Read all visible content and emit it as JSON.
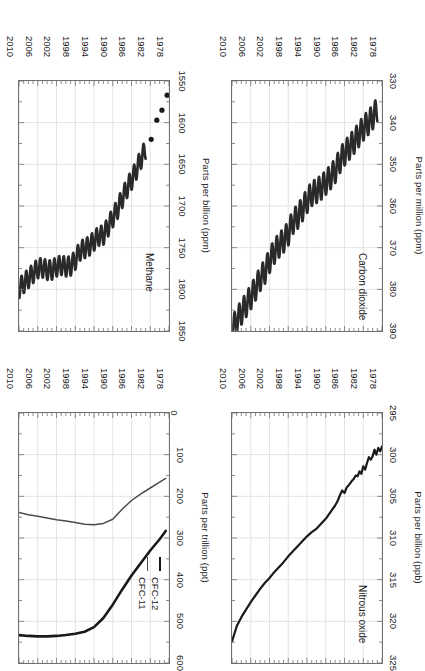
{
  "figure": {
    "orientation": "rotated-180",
    "layout": "2x2 grid of time-series panels",
    "line_color": "#1a1a1a",
    "frame_color": "#6f6f6f",
    "grid_color": "#d8d8d8"
  },
  "chart_data": [
    {
      "id": "nitrous-oxide",
      "type": "line",
      "title": "Nitrous oxide",
      "xlabel": "",
      "ylabel": "Parts per billion (ppb)",
      "xlim": [
        1978,
        2010
      ],
      "ylim": [
        295,
        325
      ],
      "yticks": [
        295,
        300,
        305,
        310,
        315,
        320,
        325
      ],
      "xticks": [
        1978,
        1982,
        1986,
        1990,
        1994,
        1998,
        2002,
        2006,
        2010
      ],
      "grid": true,
      "legend": null,
      "series": [
        {
          "name": "N2O",
          "x": [
            1978.0,
            1978.4,
            1978.8,
            1979.2,
            1979.6,
            1980.0,
            1980.4,
            1980.8,
            1981.2,
            1981.6,
            1982.0,
            1982.4,
            1982.8,
            1983.2,
            1983.6,
            1984.0,
            1984.5,
            1985.0,
            1985.5,
            1986.0,
            1986.5,
            1987.0,
            1987.5,
            1988.0,
            1989.0,
            1990.0,
            1991.0,
            1992.0,
            1993.0,
            1994.0,
            1995.0,
            1996.0,
            1997.0,
            1998.0,
            1999.0,
            2000.0,
            2001.0,
            2002.0,
            2003.0,
            2004.0,
            2005.0,
            2006.0,
            2007.0,
            2008.0,
            2009.0,
            2010.0
          ],
          "y": [
            299.0,
            299.6,
            299.2,
            300.0,
            299.4,
            300.2,
            300.6,
            300.3,
            301.0,
            301.8,
            301.4,
            302.3,
            302.0,
            302.6,
            302.5,
            302.9,
            303.2,
            303.6,
            303.9,
            304.6,
            304.3,
            304.9,
            305.6,
            306.1,
            306.9,
            307.7,
            308.3,
            308.9,
            309.3,
            309.8,
            310.4,
            311.0,
            311.6,
            312.2,
            312.9,
            313.5,
            314.1,
            314.8,
            315.4,
            316.1,
            316.9,
            317.7,
            318.6,
            319.5,
            320.6,
            322.4
          ],
          "color": "#1a1a1a",
          "width": 2.2
        }
      ]
    },
    {
      "id": "cfc",
      "type": "line",
      "title": "",
      "xlabel": "",
      "ylabel": "Parts per trillion (ppt)",
      "xlim": [
        1978,
        2010
      ],
      "ylim": [
        0,
        600
      ],
      "yticks": [
        0,
        100,
        200,
        300,
        400,
        500,
        600
      ],
      "xticks": [
        1978,
        1982,
        1986,
        1990,
        1994,
        1998,
        2002,
        2006,
        2010
      ],
      "grid": true,
      "legend": {
        "position": "upper-left",
        "entries": [
          "CFC-12",
          "CFC-11"
        ]
      },
      "series": [
        {
          "name": "CFC-12",
          "x": [
            1978.7,
            1980,
            1982,
            1984,
            1986,
            1988,
            1990,
            1992,
            1994,
            1996,
            1998,
            2000,
            2002,
            2004,
            2006,
            2008,
            2010
          ],
          "y": [
            283,
            303,
            330,
            360,
            390,
            424,
            460,
            492,
            514,
            525,
            530,
            533,
            535,
            536,
            536,
            535,
            533
          ],
          "color": "#1a1a1a",
          "width": 2.6
        },
        {
          "name": "CFC-11",
          "x": [
            1978.7,
            1980,
            1982,
            1984,
            1986,
            1988,
            1990,
            1992,
            1994,
            1996,
            1998,
            2000,
            2002,
            2004,
            2006,
            2008,
            2010
          ],
          "y": [
            157,
            166,
            180,
            194,
            210,
            231,
            255,
            265,
            268,
            267,
            263,
            259,
            256,
            252,
            248,
            244,
            239
          ],
          "color": "#4a4a4a",
          "width": 1.5
        }
      ]
    },
    {
      "id": "carbon-dioxide",
      "type": "line",
      "title": "Carbon dioxide",
      "xlabel": "",
      "ylabel": "Parts per million (ppm)",
      "xlim": [
        1978,
        2010
      ],
      "ylim": [
        330,
        390
      ],
      "yticks": [
        330,
        340,
        350,
        360,
        370,
        380,
        390
      ],
      "xticks": [
        1978,
        1982,
        1986,
        1990,
        1994,
        1998,
        2002,
        2006,
        2010
      ],
      "grid": true,
      "legend": null,
      "seasonal_amplitude": 3.0,
      "series": [
        {
          "name": "CO2 annual mean trend",
          "x": [
            1979,
            1980,
            1981,
            1982,
            1983,
            1984,
            1985,
            1986,
            1987,
            1988,
            1989,
            1990,
            1991,
            1992,
            1993,
            1994,
            1995,
            1996,
            1997,
            1998,
            1999,
            2000,
            2001,
            2002,
            2003,
            2004,
            2005,
            2006,
            2007,
            2008,
            2009,
            2010
          ],
          "y": [
            336.8,
            338.7,
            340.1,
            341.4,
            343.0,
            344.6,
            346.0,
            347.4,
            349.2,
            351.6,
            353.1,
            354.4,
            355.6,
            356.4,
            357.1,
            358.8,
            360.8,
            362.6,
            363.8,
            366.6,
            368.3,
            369.5,
            371.0,
            373.2,
            375.8,
            377.5,
            379.8,
            381.9,
            383.8,
            385.6,
            387.4,
            389.8
          ],
          "color": "#2a2a2a",
          "width": 2.6
        }
      ]
    },
    {
      "id": "methane",
      "type": "line",
      "title": "Methane",
      "xlabel": "",
      "ylabel": "Parts per billion (ppm)",
      "xlim": [
        1978,
        2010
      ],
      "ylim": [
        1550,
        1850
      ],
      "yticks": [
        1550,
        1600,
        1650,
        1700,
        1750,
        1800,
        1850
      ],
      "xticks": [
        1978,
        1982,
        1986,
        1990,
        1994,
        1998,
        2002,
        2006,
        2010
      ],
      "grid": true,
      "legend": null,
      "seasonal_amplitude": 12,
      "early_points": {
        "x": [
          1978.4,
          1979.5,
          1980.6,
          1981.8
        ],
        "y": [
          1567,
          1585,
          1597,
          1620
        ]
      },
      "series": [
        {
          "name": "CH4 annual mean trend",
          "x": [
            1983,
            1984,
            1985,
            1986,
            1987,
            1988,
            1989,
            1990,
            1991,
            1992,
            1993,
            1994,
            1995,
            1996,
            1997,
            1998,
            1999,
            2000,
            2001,
            2002,
            2003,
            2004,
            2005,
            2006,
            2007,
            2008,
            2009,
            2010
          ],
          "y": [
            1632,
            1644,
            1657,
            1669,
            1679,
            1691,
            1704,
            1714,
            1725,
            1735,
            1736,
            1742,
            1748,
            1751,
            1754,
            1765,
            1772,
            1773,
            1771,
            1773,
            1777,
            1777,
            1774,
            1775,
            1781,
            1787,
            1793,
            1799
          ],
          "color": "#2a2a2a",
          "width": 2.6
        }
      ]
    }
  ]
}
